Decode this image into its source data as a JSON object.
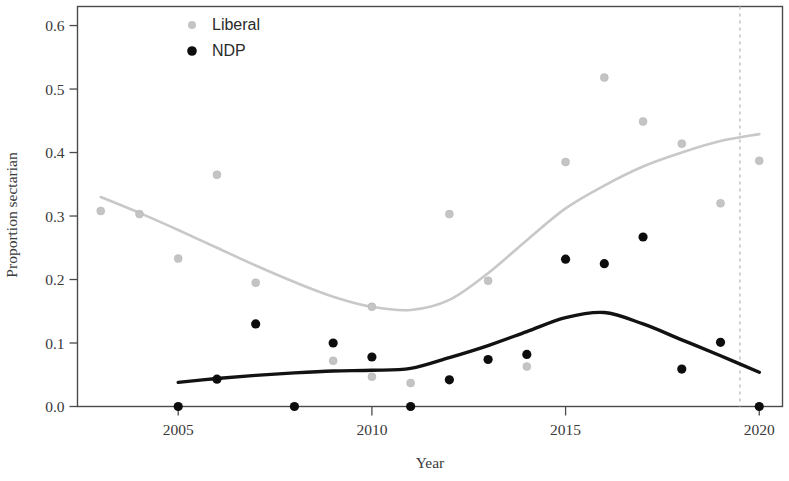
{
  "chart_data": {
    "type": "scatter",
    "title": "",
    "xlabel": "Year",
    "ylabel": "Proportion sectarian",
    "xlim": [
      2002.4,
      2020.6
    ],
    "ylim": [
      0.0,
      0.63
    ],
    "grid": false,
    "legend_position": "top-left",
    "x_ticks": [
      2005,
      2010,
      2015,
      2020
    ],
    "x_tick_labels": [
      "2005",
      "2010",
      "2015",
      "2020"
    ],
    "y_ticks": [
      0.0,
      0.1,
      0.2,
      0.3,
      0.4,
      0.5,
      0.6
    ],
    "y_tick_labels": [
      "0.0",
      "0.1",
      "0.2",
      "0.3",
      "0.4",
      "0.5",
      "0.6"
    ],
    "annotations": [
      {
        "name": "election-marker",
        "type": "vertical-dashed-line",
        "x": 2019.5
      }
    ],
    "series": [
      {
        "name": "Liberal",
        "color": "#c4c4c4",
        "marker": "circle",
        "points": [
          {
            "x": 2003,
            "y": 0.308
          },
          {
            "x": 2004,
            "y": 0.303
          },
          {
            "x": 2005,
            "y": 0.233
          },
          {
            "x": 2006,
            "y": 0.365
          },
          {
            "x": 2007,
            "y": 0.195
          },
          {
            "x": 2009,
            "y": 0.072
          },
          {
            "x": 2010,
            "y": 0.047
          },
          {
            "x": 2010,
            "y": 0.157
          },
          {
            "x": 2011,
            "y": 0.037
          },
          {
            "x": 2012,
            "y": 0.303
          },
          {
            "x": 2013,
            "y": 0.198
          },
          {
            "x": 2014,
            "y": 0.063
          },
          {
            "x": 2015,
            "y": 0.385
          },
          {
            "x": 2016,
            "y": 0.518
          },
          {
            "x": 2017,
            "y": 0.449
          },
          {
            "x": 2018,
            "y": 0.414
          },
          {
            "x": 2019,
            "y": 0.32
          },
          {
            "x": 2020,
            "y": 0.387
          }
        ],
        "trend": [
          {
            "x": 2003,
            "y": 0.33
          },
          {
            "x": 2004,
            "y": 0.305
          },
          {
            "x": 2005,
            "y": 0.278
          },
          {
            "x": 2006,
            "y": 0.25
          },
          {
            "x": 2007,
            "y": 0.222
          },
          {
            "x": 2008,
            "y": 0.196
          },
          {
            "x": 2009,
            "y": 0.173
          },
          {
            "x": 2010,
            "y": 0.157
          },
          {
            "x": 2011,
            "y": 0.152
          },
          {
            "x": 2012,
            "y": 0.168
          },
          {
            "x": 2013,
            "y": 0.21
          },
          {
            "x": 2014,
            "y": 0.262
          },
          {
            "x": 2015,
            "y": 0.312
          },
          {
            "x": 2016,
            "y": 0.348
          },
          {
            "x": 2017,
            "y": 0.378
          },
          {
            "x": 2018,
            "y": 0.4
          },
          {
            "x": 2019,
            "y": 0.418
          },
          {
            "x": 2020,
            "y": 0.429
          }
        ]
      },
      {
        "name": "NDP",
        "color": "#0d0d0d",
        "marker": "circle",
        "points": [
          {
            "x": 2005,
            "y": 0.0
          },
          {
            "x": 2006,
            "y": 0.043
          },
          {
            "x": 2007,
            "y": 0.13
          },
          {
            "x": 2008,
            "y": 0.0
          },
          {
            "x": 2009,
            "y": 0.1
          },
          {
            "x": 2010,
            "y": 0.078
          },
          {
            "x": 2011,
            "y": 0.0
          },
          {
            "x": 2012,
            "y": 0.042
          },
          {
            "x": 2013,
            "y": 0.074
          },
          {
            "x": 2014,
            "y": 0.082
          },
          {
            "x": 2015,
            "y": 0.232
          },
          {
            "x": 2016,
            "y": 0.225
          },
          {
            "x": 2017,
            "y": 0.267
          },
          {
            "x": 2018,
            "y": 0.059
          },
          {
            "x": 2019,
            "y": 0.101
          },
          {
            "x": 2020,
            "y": 0.0
          }
        ],
        "trend": [
          {
            "x": 2005,
            "y": 0.038
          },
          {
            "x": 2006,
            "y": 0.044
          },
          {
            "x": 2007,
            "y": 0.049
          },
          {
            "x": 2008,
            "y": 0.053
          },
          {
            "x": 2009,
            "y": 0.056
          },
          {
            "x": 2010,
            "y": 0.057
          },
          {
            "x": 2011,
            "y": 0.06
          },
          {
            "x": 2012,
            "y": 0.077
          },
          {
            "x": 2013,
            "y": 0.096
          },
          {
            "x": 2014,
            "y": 0.118
          },
          {
            "x": 2015,
            "y": 0.14
          },
          {
            "x": 2016,
            "y": 0.148
          },
          {
            "x": 2017,
            "y": 0.13
          },
          {
            "x": 2018,
            "y": 0.105
          },
          {
            "x": 2019,
            "y": 0.08
          },
          {
            "x": 2020,
            "y": 0.054
          }
        ]
      }
    ]
  },
  "legend": {
    "items": [
      {
        "label": "Liberal",
        "color": "#c4c4c4"
      },
      {
        "label": "NDP",
        "color": "#0d0d0d"
      }
    ]
  },
  "axes": {
    "x_title": "Year",
    "y_title": "Proportion sectarian"
  }
}
